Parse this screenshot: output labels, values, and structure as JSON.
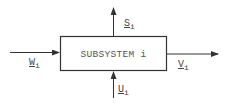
{
  "diagram": {
    "box": {
      "label": "SUBSYSTEM i"
    },
    "flows": {
      "input_left": {
        "symbol": "W",
        "subscript": "i",
        "direction": "in"
      },
      "output_right": {
        "symbol": "V",
        "subscript": "i",
        "direction": "out"
      },
      "output_top": {
        "symbol": "S",
        "subscript": "i",
        "direction": "out"
      },
      "input_bottom": {
        "symbol": "U",
        "subscript": "i",
        "direction": "in"
      }
    },
    "colors": {
      "line": "#333333",
      "text": "#444444",
      "background": "#ffffff"
    }
  }
}
